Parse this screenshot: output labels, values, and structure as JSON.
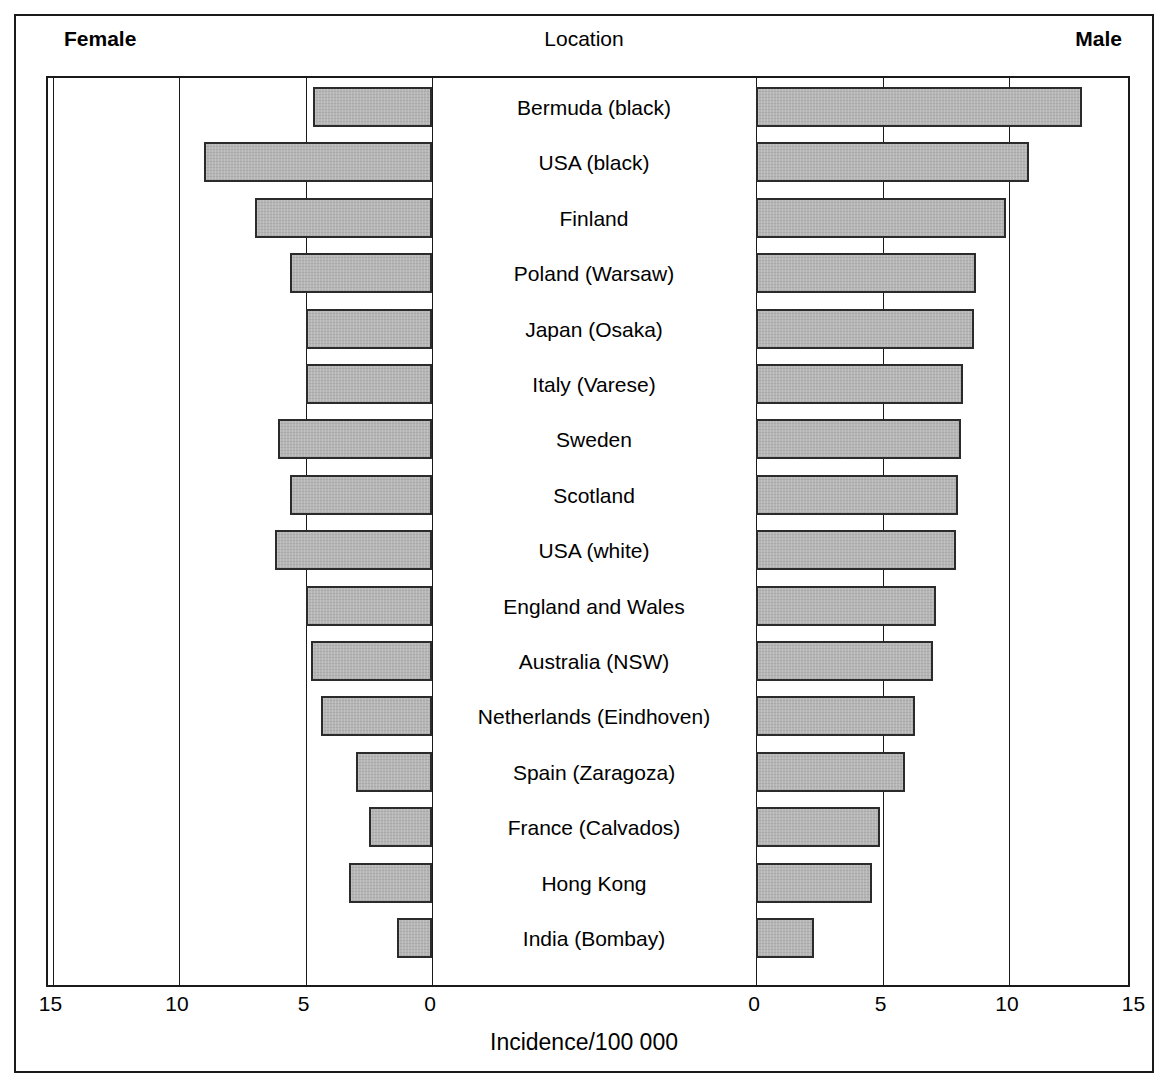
{
  "header": {
    "left_label": "Female",
    "center_label": "Location",
    "right_label": "Male"
  },
  "axis": {
    "title": "Incidence/100 000",
    "left_ticks": [
      "15",
      "10",
      "5",
      "0"
    ],
    "right_ticks": [
      "0",
      "5",
      "10",
      "15"
    ]
  },
  "chart_data": {
    "type": "bar",
    "orientation": "horizontal",
    "style": "bidirectional-population-pyramid",
    "title": "",
    "xlabel": "Incidence/100 000",
    "ylabel": "Location",
    "grid": true,
    "legend_position": "top",
    "xlim_left": [
      0,
      15
    ],
    "xlim_right": [
      0,
      15
    ],
    "left_axis_direction": "right-to-left",
    "left_tick_values": [
      15,
      10,
      5,
      0
    ],
    "right_tick_values": [
      0,
      5,
      10,
      15
    ],
    "categories": [
      "Bermuda (black)",
      "USA (black)",
      "Finland",
      "Poland (Warsaw)",
      "Japan (Osaka)",
      "Italy (Varese)",
      "Sweden",
      "Scotland",
      "USA (white)",
      "England and Wales",
      "Australia (NSW)",
      "Netherlands (Eindhoven)",
      "Spain (Zaragoza)",
      "France (Calvados)",
      "Hong Kong",
      "India (Bombay)"
    ],
    "series": [
      {
        "name": "Female",
        "side": "left",
        "values": [
          4.7,
          9.0,
          7.0,
          5.6,
          5.0,
          5.0,
          6.1,
          5.6,
          6.2,
          5.0,
          4.8,
          4.4,
          3.0,
          2.5,
          3.3,
          1.4
        ]
      },
      {
        "name": "Male",
        "side": "right",
        "values": [
          12.9,
          10.8,
          9.9,
          8.7,
          8.6,
          8.2,
          8.1,
          8.0,
          7.9,
          7.1,
          7.0,
          6.3,
          5.9,
          4.9,
          4.6,
          2.3
        ]
      }
    ]
  },
  "colors": {
    "bar_fill": "#b2b2b2",
    "bar_stroke": "#2b2b2b",
    "frame": "#1a1a1a",
    "text": "#000000"
  }
}
